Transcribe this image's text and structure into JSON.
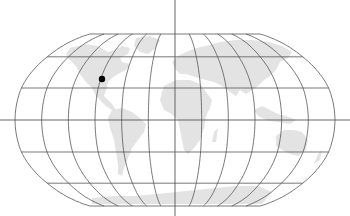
{
  "map": {
    "projection": "Robinson",
    "graticule_spacing_deg": 30,
    "colors": {
      "background": "#ffffff",
      "land": "#e3e3e3",
      "graticule": "#555555",
      "axis": "#555555",
      "marker": "#000000"
    },
    "markers": [
      {
        "label": "marker",
        "region": "central United States",
        "x": 102,
        "y": 79,
        "r": 3.2
      }
    ]
  }
}
